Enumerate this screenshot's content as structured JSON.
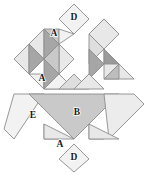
{
  "figure": {
    "background_color": "#ffffff",
    "outline_color": "#8c8c8c",
    "canvas": {
      "width": 155,
      "height": 175
    },
    "palette": {
      "very_light": "#f2f2f2",
      "light": "#e8e8e8",
      "pale": "#dedede",
      "medium": "#c9c9c9",
      "medium_dark": "#bdbdbd",
      "dark": "#a6a6a6",
      "darkest": "#9a9a9a",
      "stroke": "#8c8c8c",
      "label_text": "#1a1a1a"
    },
    "labels": [
      {
        "id": "label-d-top",
        "text": "D",
        "x": 74,
        "y": 18
      },
      {
        "id": "label-a-top",
        "text": "A",
        "x": 54,
        "y": 34
      },
      {
        "id": "label-a-mid",
        "text": "A",
        "x": 42,
        "y": 79
      },
      {
        "id": "label-b",
        "text": "B",
        "x": 77,
        "y": 113
      },
      {
        "id": "label-e",
        "text": "E",
        "x": 33,
        "y": 116
      },
      {
        "id": "label-a-bottom",
        "text": "A",
        "x": 60,
        "y": 145
      },
      {
        "id": "label-d-bottom",
        "text": "D",
        "x": 74,
        "y": 158
      }
    ],
    "pieces": [
      {
        "id": "d-top-square",
        "name": "square-piece-d-top",
        "points": "74,4 89,19 74,34 59,19",
        "fill": "#f2f2f2"
      },
      {
        "id": "a-top-left-tri",
        "name": "triangle-piece-a-top-left",
        "points": "44,29 59,29 59,44",
        "fill": "#c9c9c9"
      },
      {
        "id": "a-top-right-tri",
        "name": "triangle-piece-a-top-right",
        "points": "59,29 74,34 59,44",
        "fill": "#f2f2f2"
      },
      {
        "id": "diamond-left-upper-l",
        "name": "triangle-upper-left-light",
        "points": "29,44 44,29 44,59",
        "fill": "#e8e8e8"
      },
      {
        "id": "diamond-left-upper-d",
        "name": "triangle-upper-left-dark",
        "points": "44,29 59,44 44,59",
        "fill": "#a6a6a6"
      },
      {
        "id": "diamond-left-lower-l",
        "name": "triangle-mid-left-light",
        "points": "14,59 29,44 29,74",
        "fill": "#e8e8e8"
      },
      {
        "id": "diamond-left-lower-d",
        "name": "triangle-mid-left-dark",
        "points": "29,44 44,59 29,74",
        "fill": "#a6a6a6"
      },
      {
        "id": "a-mid-left-tri",
        "name": "triangle-piece-a-mid-left",
        "points": "29,74 44,74 44,89",
        "fill": "#f2f2f2"
      },
      {
        "id": "a-mid-right-tri",
        "name": "triangle-piece-a-mid-right",
        "points": "44,74 59,89 44,89",
        "fill": "#e8e8e8"
      },
      {
        "id": "center-upper-tri-l",
        "name": "triangle-center-upper-light",
        "points": "59,44 74,59 59,74",
        "fill": "#e8e8e8"
      },
      {
        "id": "center-upper-tri-d",
        "name": "triangle-center-upper-dark",
        "points": "44,59 59,44 59,74",
        "fill": "#c9c9c9"
      },
      {
        "id": "center-core-tri-d",
        "name": "triangle-center-core-dark",
        "points": "44,59 59,74 44,89",
        "fill": "#a6a6a6"
      },
      {
        "id": "center-core-tri-l",
        "name": "triangle-center-core-light",
        "points": "59,74 74,89 44,89",
        "fill": "#f2f2f2"
      },
      {
        "id": "top-right-sq-left",
        "name": "triangle-top-right-square-left",
        "points": "89,34 104,49 89,64",
        "fill": "#dedede"
      },
      {
        "id": "top-right-sq-right",
        "name": "triangle-top-right-square-rt",
        "points": "89,34 104,49 119,34 104,19",
        "fill": "#e8e8e8"
      },
      {
        "id": "right-dark-tri",
        "name": "triangle-right-dark",
        "points": "89,49 104,64 89,79",
        "fill": "#a6a6a6"
      },
      {
        "id": "right-upper-tri-l",
        "name": "triangle-right-upper-light",
        "points": "104,49 119,64 104,79",
        "fill": "#e8e8e8"
      },
      {
        "id": "right-core-dark",
        "name": "triangle-right-core-dark",
        "points": "104,49 119,64 104,64",
        "fill": "#9a9a9a"
      },
      {
        "id": "right-lower-tri",
        "name": "triangle-right-lower",
        "points": "74,74 89,89 59,89",
        "fill": "#dedede"
      },
      {
        "id": "right-lower-tri2",
        "name": "triangle-right-lower-second",
        "points": "89,74 104,89 74,89",
        "fill": "#e8e8e8"
      },
      {
        "id": "far-right-tri-l",
        "name": "triangle-far-right-light",
        "points": "119,64 134,79 104,79",
        "fill": "#e8e8e8"
      },
      {
        "id": "far-right-tri-d",
        "name": "triangle-far-right-dark",
        "points": "119,64 119,79 104,79",
        "fill": "#bdbdbd"
      },
      {
        "id": "e-parallelogram",
        "name": "parallelogram-piece-e",
        "points": "14,94 44,94 14,139 4,129",
        "fill": "#f2f2f2"
      },
      {
        "id": "b-triangle",
        "name": "triangle-piece-b-large",
        "points": "29,94 119,94 74,139",
        "fill": "#c9c9c9"
      },
      {
        "id": "right-parallelogram",
        "name": "parallelogram-right",
        "points": "104,94 134,94 144,104 109,139",
        "fill": "#ececec"
      },
      {
        "id": "a-bottom-left",
        "name": "triangle-piece-a-bottom-left",
        "points": "44,124 59,139 44,139",
        "fill": "#bdbdbd"
      },
      {
        "id": "a-bottom-right",
        "name": "triangle-piece-a-bottom-right",
        "points": "44,124 74,139 44,139",
        "fill": "#e8e8e8"
      },
      {
        "id": "br-dark-tri",
        "name": "triangle-bottom-right-dark",
        "points": "89,124 104,139 89,139",
        "fill": "#bdbdbd"
      },
      {
        "id": "br-light-tri",
        "name": "triangle-bottom-right-light",
        "points": "89,124 119,139 89,139",
        "fill": "#e8e8e8"
      },
      {
        "id": "d-bottom-square",
        "name": "square-piece-d-bottom",
        "points": "74,144 89,159 74,172 59,159",
        "fill": "#f2f2f2"
      }
    ]
  }
}
